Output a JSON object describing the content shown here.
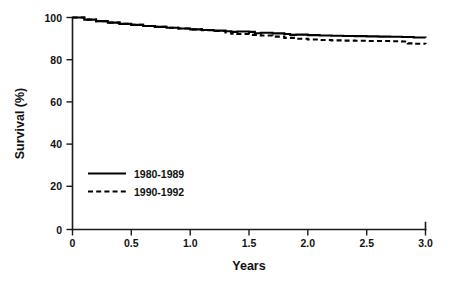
{
  "chart_data": {
    "type": "line",
    "title": "",
    "subtitle": "",
    "xlabel": "Years",
    "ylabel": "Survival (%)",
    "xlim": [
      0,
      3.0
    ],
    "ylim": [
      0,
      100
    ],
    "grid": false,
    "legend_position": "inside-lower-left",
    "xticks": [
      0,
      0.5,
      1.0,
      1.5,
      2.0,
      2.5,
      3.0
    ],
    "xtick_labels": [
      "0",
      "0.5",
      "1.0",
      "1.5",
      "2.0",
      "2.5",
      "3.0"
    ],
    "yticks": [
      0,
      20,
      40,
      60,
      80,
      100
    ],
    "ytick_labels": [
      "0",
      "20",
      "40",
      "60",
      "80",
      "100"
    ],
    "series": [
      {
        "name": "1980-1989",
        "style": "solid",
        "color": "#000000",
        "x": [
          0,
          0.1,
          0.2,
          0.3,
          0.4,
          0.5,
          0.6,
          0.7,
          0.8,
          0.9,
          1.0,
          1.1,
          1.2,
          1.3,
          1.35,
          1.4,
          1.5,
          1.55,
          1.6,
          1.7,
          1.8,
          1.85,
          1.9,
          2.0,
          2.1,
          2.2,
          2.3,
          2.4,
          2.5,
          2.6,
          2.7,
          2.8,
          2.9,
          3.0
        ],
        "values": [
          100.0,
          99.0,
          98.3,
          97.6,
          97.0,
          96.5,
          96.0,
          95.6,
          95.2,
          94.8,
          94.4,
          94.1,
          93.8,
          93.5,
          93.2,
          93.4,
          93.2,
          92.6,
          92.8,
          92.5,
          92.2,
          91.8,
          91.9,
          91.7,
          91.5,
          91.4,
          91.3,
          91.2,
          91.1,
          91.0,
          90.9,
          90.8,
          90.6,
          90.5
        ]
      },
      {
        "name": "1990-1992",
        "style": "dashed",
        "color": "#000000",
        "x": [
          0,
          0.1,
          0.2,
          0.3,
          0.4,
          0.5,
          0.6,
          0.7,
          0.8,
          0.9,
          1.0,
          1.1,
          1.2,
          1.3,
          1.35,
          1.4,
          1.5,
          1.6,
          1.7,
          1.8,
          1.9,
          2.0,
          2.1,
          2.2,
          2.3,
          2.4,
          2.5,
          2.6,
          2.7,
          2.8,
          2.85,
          2.9,
          3.0
        ],
        "values": [
          100.0,
          99.0,
          98.3,
          97.6,
          97.0,
          96.5,
          96.0,
          95.6,
          95.2,
          94.8,
          94.4,
          94.0,
          93.6,
          93.0,
          92.4,
          92.2,
          91.8,
          91.5,
          91.0,
          90.4,
          90.0,
          89.6,
          89.4,
          89.2,
          89.1,
          89.0,
          88.9,
          88.9,
          88.8,
          88.7,
          87.8,
          87.6,
          87.5
        ]
      }
    ],
    "legend": [
      {
        "label": "1980-1989",
        "style": "solid"
      },
      {
        "label": "1990-1992",
        "style": "dashed"
      }
    ]
  }
}
